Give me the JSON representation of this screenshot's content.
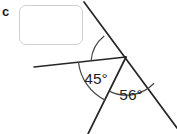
{
  "figure": {
    "part_label": "c",
    "background_color": "#ffffff",
    "line_color": "#262626",
    "text_color": "#1f1f1f",
    "box_border_color": "#cfcfcf",
    "answer_box": {
      "value": "",
      "placeholder": ""
    },
    "vertex": {
      "x": 126,
      "y": 57
    },
    "rays": [
      {
        "name": "ray-up-right-diagonal",
        "to_x": 84,
        "to_y": 2
      },
      {
        "name": "ray-down-right-diagonal",
        "to_x": 177,
        "to_y": 128
      },
      {
        "name": "ray-left-horizontal",
        "to_x": 34,
        "to_y": 67
      },
      {
        "name": "ray-down-left",
        "to_x": 88,
        "to_y": 134
      }
    ],
    "angles": [
      {
        "name": "unknown-angle",
        "label": "",
        "arc_radius": 35,
        "between": [
          "ray-up-right-diagonal",
          "ray-left-horizontal"
        ]
      },
      {
        "name": "angle-45",
        "label": "45°",
        "value": 45,
        "unit": "degrees",
        "arc_radius": 48,
        "label_x": 96,
        "label_y": 84,
        "between": [
          "ray-left-horizontal",
          "ray-down-left"
        ]
      },
      {
        "name": "angle-56",
        "label": "56°",
        "value": 56,
        "unit": "degrees",
        "arc_radius": 38,
        "label_x": 131,
        "label_y": 100,
        "between": [
          "ray-down-left",
          "ray-down-right-diagonal"
        ]
      }
    ]
  }
}
